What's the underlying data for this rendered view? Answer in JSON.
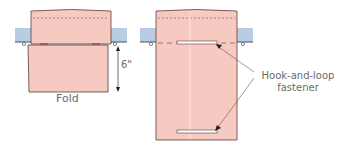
{
  "diagram": {
    "left_figure": {
      "caption": "Fold",
      "dimension": "6\""
    },
    "right_figure": {
      "callout_line1": "Hook-and-loop",
      "callout_line2": "fastener"
    }
  },
  "colors": {
    "fabric": "#f6c9c1",
    "fabric_outline": "#5a3e3c",
    "rod": "#b8cce3",
    "rod_outline": "#4a5560",
    "text": "#6e6a68",
    "fastener_fill": "#ffffff"
  }
}
